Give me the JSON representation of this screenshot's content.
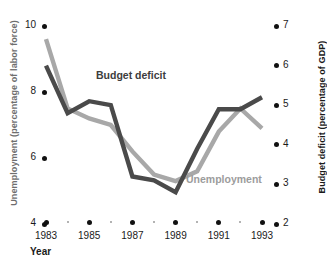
{
  "chart_data": {
    "type": "line",
    "title": "",
    "xlabel": "Year",
    "x": [
      1983,
      1984,
      1985,
      1986,
      1987,
      1988,
      1989,
      1990,
      1991,
      1992,
      1993
    ],
    "xticks": [
      "1983",
      "1985",
      "1987",
      "1989",
      "1991",
      "1993"
    ],
    "grid": false,
    "legend_position": "inline-annotation",
    "axes": {
      "left": {
        "label": "Unemployment (percentage of labor force)",
        "ticks": [
          "10",
          "8",
          "6",
          "4"
        ],
        "tick_values": [
          10,
          8,
          6,
          4
        ],
        "range": [
          4,
          10
        ]
      },
      "right": {
        "label": "Budget deficit (percentage of GDP)",
        "ticks": [
          "7",
          "6",
          "5",
          "4",
          "3",
          "2"
        ],
        "tick_values": [
          7,
          6,
          5,
          4,
          3,
          2
        ],
        "range": [
          2,
          7
        ]
      }
    },
    "series": [
      {
        "name": "Unemployment",
        "axis": "left",
        "color": "#a8a8a8",
        "label_text": "Unemployment",
        "values": [
          9.6,
          7.5,
          7.2,
          7.0,
          6.2,
          5.5,
          5.3,
          5.6,
          6.8,
          7.5,
          6.9
        ]
      },
      {
        "name": "Budget deficit",
        "axis": "right",
        "color": "#4a4a4a",
        "label_text": "Budget deficit",
        "values": [
          6.0,
          4.8,
          5.1,
          5.0,
          3.2,
          3.1,
          2.8,
          3.9,
          4.9,
          4.9,
          5.2
        ]
      }
    ]
  }
}
